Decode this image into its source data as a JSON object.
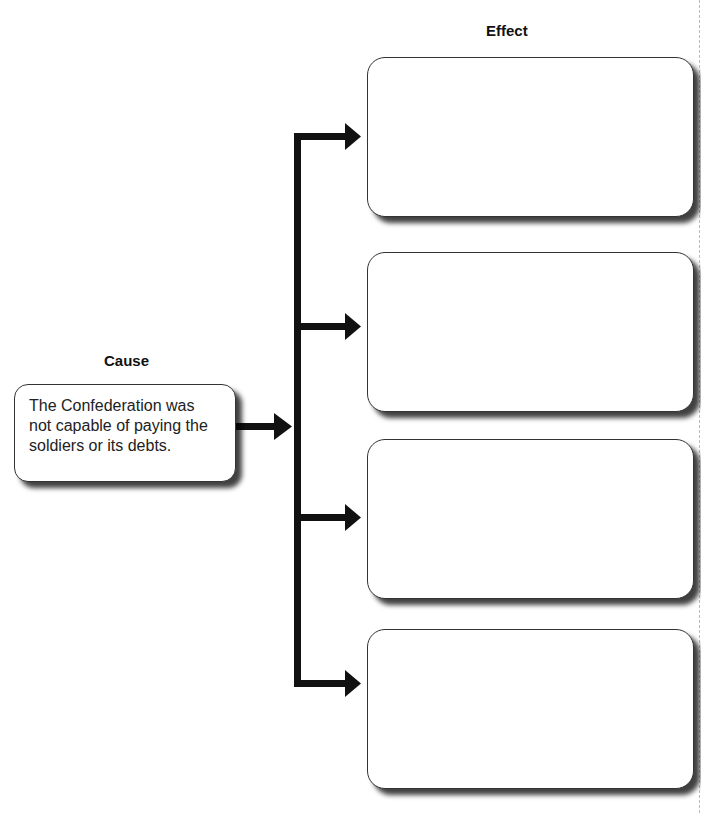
{
  "diagram": {
    "type": "cause-and-effect graphic organizer",
    "cause": {
      "heading": "Cause",
      "text": "The Confederation was not capable of paying the soldiers or its debts."
    },
    "effect": {
      "heading": "Effect",
      "boxes": [
        {
          "text": ""
        },
        {
          "text": ""
        },
        {
          "text": ""
        },
        {
          "text": ""
        }
      ]
    },
    "colors": {
      "line": "#111111",
      "box_border": "#333333",
      "shadow": "#000000",
      "background": "#ffffff"
    }
  }
}
